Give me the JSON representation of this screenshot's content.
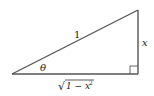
{
  "diagram": {
    "type": "right-triangle",
    "hypotenuse_label": "1",
    "angle_label": "θ",
    "opposite_label": "x",
    "adjacent_label": "1 − x",
    "adjacent_exponent": "2",
    "adjacent_radical": "√",
    "stroke_color": "#555555",
    "label_color": "#222222"
  }
}
